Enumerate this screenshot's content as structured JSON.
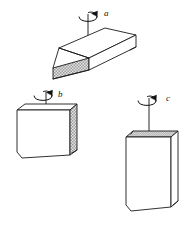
{
  "figure": {
    "background_color": "#ffffff",
    "line_color": "#1a1a1a",
    "shade_fill_color": "#cfcfcf",
    "width": 193,
    "height": 225,
    "objects": [
      {
        "id": "block-a",
        "label": "a",
        "axis_name": "vertical-axis-a",
        "orientation": "flat slab lying horizontally, viewed from above",
        "shaded_face": "front-edge",
        "axis_top_y": 14,
        "axis_bottom_y": 52,
        "label_x": 104,
        "label_y": 16,
        "rotation_direction": "counterclockwise-viewed-from-above"
      },
      {
        "id": "block-b",
        "label": "b",
        "axis_name": "vertical-axis-b",
        "orientation": "slab standing on long edge, long axis horizontal",
        "shaded_face": "right-side-face",
        "axis_top_y": 92,
        "axis_bottom_y": 112,
        "label_x": 58,
        "label_y": 97,
        "rotation_direction": "counterclockwise-viewed-from-above"
      },
      {
        "id": "block-c",
        "label": "c",
        "axis_name": "vertical-axis-c",
        "orientation": "slab standing upright on short edge, long axis vertical",
        "shaded_face": "top-face",
        "axis_top_y": 98,
        "axis_bottom_y": 137,
        "label_x": 166,
        "label_y": 101,
        "rotation_direction": "counterclockwise-viewed-from-above"
      }
    ]
  }
}
